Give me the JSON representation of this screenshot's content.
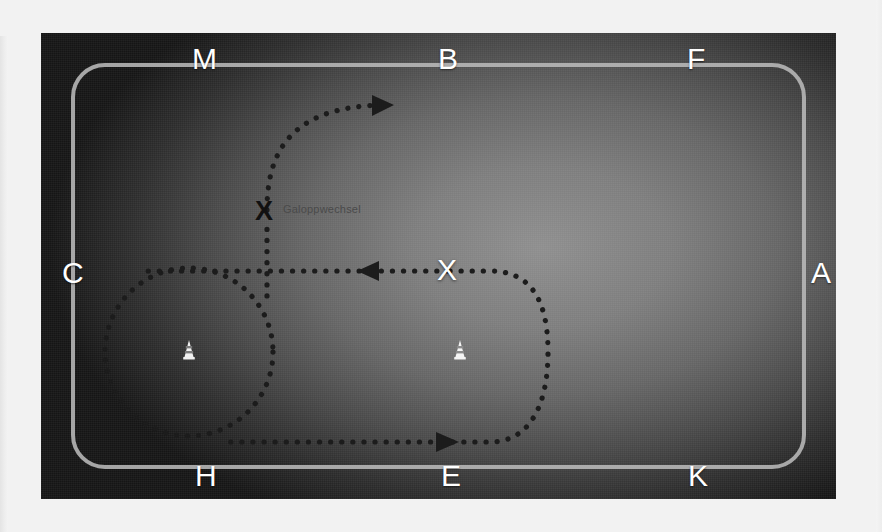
{
  "diagram": {
    "type": "dressage-arena-exercise",
    "title": "Galoppwechsel",
    "arena_letters": {
      "top": [
        {
          "label": "M"
        },
        {
          "label": "B"
        },
        {
          "label": "F"
        }
      ],
      "bottom": [
        {
          "label": "H"
        },
        {
          "label": "E"
        },
        {
          "label": "K"
        }
      ],
      "left": [
        {
          "label": "C"
        }
      ],
      "right": [
        {
          "label": "A"
        }
      ]
    },
    "center_marker": {
      "label": "X",
      "name": "arena-center-point"
    },
    "annotation": {
      "marker": "X",
      "label": "Galoppwechsel"
    },
    "cones": [
      {
        "name": "cone-left",
        "x": 189,
        "y": 350
      },
      {
        "name": "cone-right",
        "x": 460,
        "y": 350
      }
    ],
    "arrows": [
      {
        "name": "arrow-top-right",
        "direction": "right",
        "x": 386,
        "y": 105
      },
      {
        "name": "arrow-middle-left",
        "direction": "left",
        "x": 366,
        "y": 271
      },
      {
        "name": "arrow-bottom-right",
        "direction": "right",
        "x": 450,
        "y": 442
      }
    ],
    "colors": {
      "arena_dark": "#1a1a1a",
      "arena_light": "#8e8e8e",
      "rail": "#b9b9b9",
      "letter": "#ffffff",
      "path": "#1c1c1c",
      "label_text": "#4a4a4a",
      "page_bg": "#f2f2f2"
    }
  }
}
